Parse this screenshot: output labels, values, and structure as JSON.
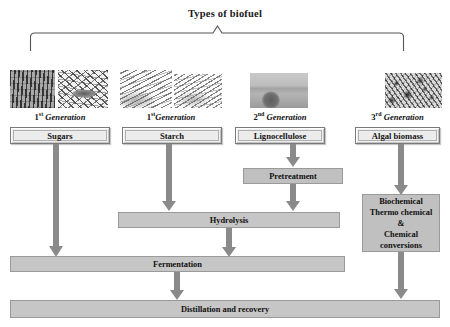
{
  "diagram": {
    "title": "Types of biofuel",
    "colors": {
      "arrow": "#8a8a8a",
      "process_box": "#c0c0c0",
      "feedstock_box": "#f0f0f0",
      "bracket": "#555555",
      "text": "#101010"
    },
    "generations": [
      {
        "ordinal": "1",
        "suffix": "st",
        "word": "Generation",
        "feedstock": "Sugars",
        "image": "sugarcane-and-sugarbeet-photo"
      },
      {
        "ordinal": "1",
        "suffix": "st",
        "word": "Generation",
        "feedstock": "Starch",
        "image": "wheat-grain-photo"
      },
      {
        "ordinal": "2",
        "suffix": "nd",
        "word": "Generation",
        "feedstock": "Lignocellulose",
        "image": "hay-bale-field-photo"
      },
      {
        "ordinal": "3",
        "suffix": "rd",
        "word": "Generation",
        "feedstock": "Algal biomass",
        "image": "algae-photo"
      }
    ],
    "processes": {
      "pretreatment": "Pretreatment",
      "hydrolysis": "Hydrolysis",
      "fermentation": "Fermentation",
      "distillation": "Distillation and recovery",
      "conversions": [
        "Biochemical",
        "Thermo chemical",
        "&",
        "Chemical",
        "conversions"
      ]
    }
  }
}
